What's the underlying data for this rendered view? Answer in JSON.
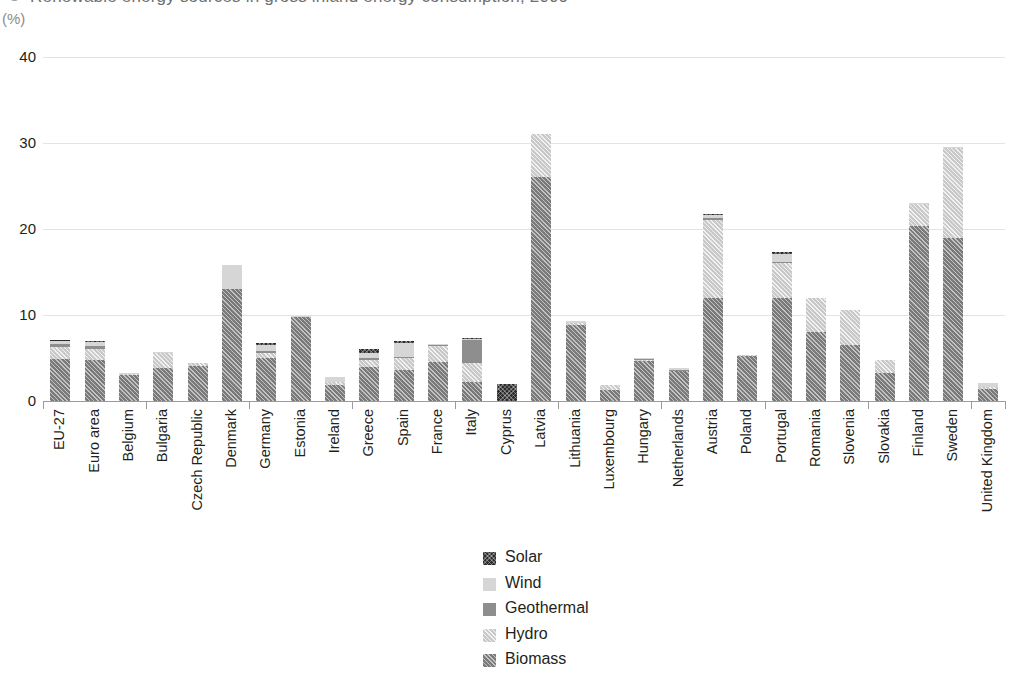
{
  "header": {
    "title_clipped": "Renewable energy sources in gross inland energy consumption, 2009",
    "bullet_icon": "bullet-icon"
  },
  "axis": {
    "unit_label": "(%)",
    "y_ticks": [
      "0",
      "10",
      "20",
      "30",
      "40"
    ]
  },
  "legend": {
    "items": [
      {
        "label": "Solar",
        "key": "solar",
        "color": "#2b2b2b",
        "swatch_icon": "solar-swatch-icon"
      },
      {
        "label": "Wind",
        "key": "wind",
        "color": "#d6d6d6",
        "swatch_icon": "wind-swatch-icon"
      },
      {
        "label": "Geothermal",
        "key": "geothermal",
        "color": "#8e8e8e",
        "swatch_icon": "geothermal-swatch-icon"
      },
      {
        "label": "Hydro",
        "key": "hydro",
        "color": "#c9c9c9",
        "swatch_icon": "hydro-swatch-icon"
      },
      {
        "label": "Biomass",
        "key": "biomass",
        "color": "#7a7a7a",
        "swatch_icon": "biomass-swatch-icon"
      }
    ]
  },
  "chart_data": {
    "type": "bar",
    "stacked": true,
    "title": "Renewable energy sources in gross inland energy consumption, 2009",
    "xlabel": "",
    "ylabel": "(%)",
    "ylim": [
      0,
      40
    ],
    "yticks": [
      0,
      10,
      20,
      30,
      40
    ],
    "grid": true,
    "legend_position": "bottom-center",
    "categories": [
      "EU-27",
      "Euro area",
      "Belgium",
      "Bulgaria",
      "Czech Republic",
      "Denmark",
      "Germany",
      "Estonia",
      "Ireland",
      "Greece",
      "Spain",
      "France",
      "Italy",
      "Cyprus",
      "Latvia",
      "Lithuania",
      "Luxembourg",
      "Hungary",
      "Netherlands",
      "Austria",
      "Poland",
      "Portugal",
      "Romania",
      "Slovenia",
      "Slovakia",
      "Finland",
      "Sweden",
      "United Kingdom"
    ],
    "series": [
      {
        "name": "Biomass",
        "key": "biomass",
        "values": [
          4.9,
          4.8,
          3.0,
          3.8,
          4.1,
          13.0,
          5.0,
          9.8,
          1.9,
          3.9,
          3.6,
          4.5,
          2.2,
          0.0,
          26.0,
          8.8,
          1.3,
          4.7,
          3.5,
          12.0,
          5.2,
          12.0,
          8.0,
          6.5,
          3.2,
          20.4,
          18.9,
          1.4
        ]
      },
      {
        "name": "Hydro",
        "key": "hydro",
        "values": [
          1.4,
          1.3,
          0.1,
          1.8,
          0.3,
          0.0,
          0.6,
          0.0,
          0.3,
          0.9,
          1.4,
          1.9,
          2.2,
          0.0,
          5.1,
          0.3,
          0.6,
          0.1,
          0.0,
          9.0,
          0.2,
          4.0,
          4.0,
          4.1,
          1.6,
          2.5,
          10.5,
          0.2
        ]
      },
      {
        "name": "Geothermal",
        "key": "geothermal",
        "values": [
          0.3,
          0.3,
          0.0,
          0.0,
          0.0,
          0.0,
          0.2,
          0.0,
          0.0,
          0.2,
          0.1,
          0.1,
          2.7,
          0.0,
          0.0,
          0.0,
          0.0,
          0.1,
          0.1,
          0.3,
          0.0,
          0.2,
          0.0,
          0.0,
          0.0,
          0.0,
          0.0,
          0.0
        ]
      },
      {
        "name": "Wind",
        "key": "wind",
        "values": [
          0.5,
          0.5,
          0.1,
          0.1,
          0.0,
          2.8,
          0.7,
          0.1,
          0.6,
          0.6,
          1.7,
          0.1,
          0.1,
          0.0,
          0.0,
          0.2,
          0.0,
          0.1,
          0.2,
          0.3,
          0.0,
          0.9,
          0.0,
          0.0,
          0.0,
          0.1,
          0.1,
          0.5
        ]
      },
      {
        "name": "Solar",
        "key": "solar",
        "values": [
          0.05,
          0.05,
          0.0,
          0.0,
          0.0,
          0.0,
          0.2,
          0.0,
          0.0,
          0.5,
          0.2,
          0.0,
          0.1,
          2.0,
          0.0,
          0.0,
          0.0,
          0.0,
          0.0,
          0.2,
          0.0,
          0.2,
          0.0,
          0.0,
          0.0,
          0.0,
          0.0,
          0.0
        ]
      }
    ],
    "totals": [
      7.15,
      6.95,
      3.2,
      5.7,
      4.4,
      15.8,
      6.7,
      9.9,
      2.8,
      6.1,
      7.0,
      6.6,
      7.3,
      2.0,
      31.1,
      9.3,
      1.9,
      5.0,
      3.8,
      21.8,
      5.4,
      17.3,
      12.0,
      10.6,
      4.8,
      23.0,
      29.5,
      2.1
    ]
  }
}
